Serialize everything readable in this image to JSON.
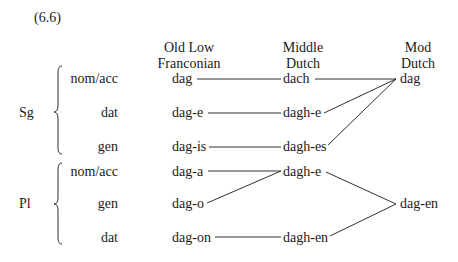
{
  "example_number": "(6.6)",
  "columns": {
    "olf": [
      "Old Low",
      "Franconian"
    ],
    "md": [
      "Middle",
      "Dutch"
    ],
    "modd": [
      "Mod",
      "Dutch"
    ]
  },
  "groups": {
    "sg": "Sg",
    "pl": "Pl"
  },
  "rows": [
    {
      "case": "nom/acc",
      "olf": "dag",
      "md": "dach"
    },
    {
      "case": "dat",
      "olf": "dag-e",
      "md": "dagh-e"
    },
    {
      "case": "gen",
      "olf": "dag-is",
      "md": "dagh-es"
    },
    {
      "case": "nom/acc",
      "olf": "dag-a",
      "md": "dagh-e"
    },
    {
      "case": "gen",
      "olf": "dag-o",
      "md": ""
    },
    {
      "case": "dat",
      "olf": "dag-on",
      "md": "dagh-en"
    }
  ],
  "modern": {
    "sg": "dag",
    "pl": "dag-en"
  },
  "colors": {
    "ink": "#1a1a1a",
    "background": "#ffffff"
  }
}
